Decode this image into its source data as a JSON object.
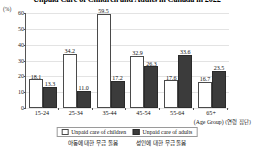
{
  "chart_data": {
    "type": "bar",
    "title": "Unpaid Care of Children and Adults in Canada in 2022",
    "xlabel": "(Age Group)",
    "ylabel": "(%)",
    "ylim": [
      0,
      60
    ],
    "yticks": [
      0,
      10,
      20,
      30,
      40,
      50,
      60
    ],
    "grid": true,
    "legend_position": "bottom",
    "categories": [
      "15-24",
      "25-34",
      "35-44",
      "45-54",
      "55-64",
      "65+"
    ],
    "series": [
      {
        "name": "Unpaid care of children",
        "color": "#ffffff",
        "values": [
          18.1,
          34.2,
          59.5,
          32.9,
          17.6,
          16.7
        ]
      },
      {
        "name": "Unpaid care of adults",
        "color": "#3b3b3b",
        "values": [
          13.3,
          11.0,
          17.2,
          26.3,
          33.6,
          23.5
        ]
      }
    ]
  },
  "axis": {
    "unit_label": "(%)",
    "x_caption_en": "(Age Group)",
    "x_caption_kr": "(연령 집단)"
  },
  "legend": {
    "items": [
      {
        "label": "Unpaid care of children",
        "swatch": "children"
      },
      {
        "label": "Unpaid care of adults",
        "swatch": "adults"
      }
    ],
    "sublabels": [
      "아동에 대한 무급 돌봄",
      "성인에 대한 무급 돌봄"
    ]
  }
}
